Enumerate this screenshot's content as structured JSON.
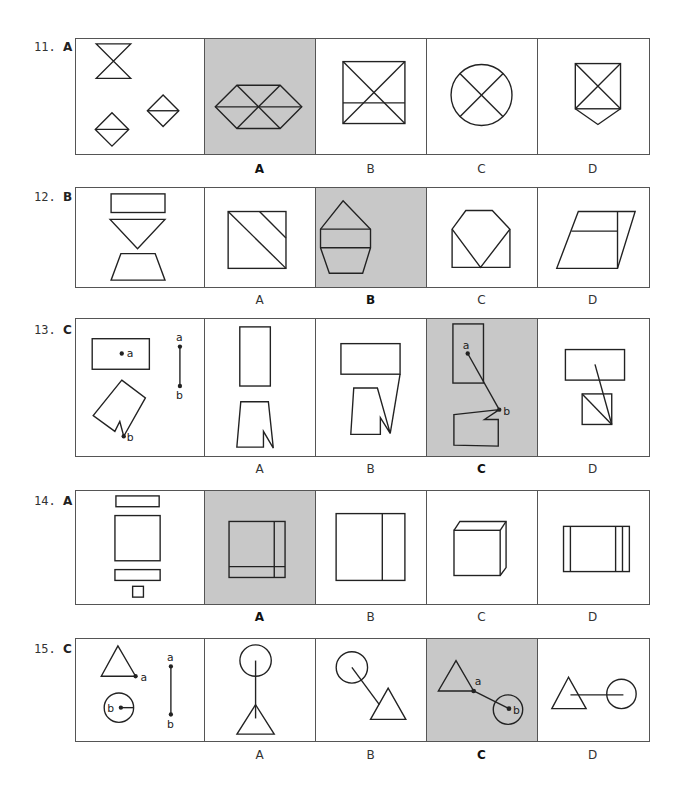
{
  "questions": [
    {
      "number": "11.",
      "answer": "A",
      "options": [
        "A",
        "B",
        "C",
        "D"
      ],
      "correct_index": 0
    },
    {
      "number": "12.",
      "answer": "B",
      "options": [
        "A",
        "B",
        "C",
        "D"
      ],
      "correct_index": 1
    },
    {
      "number": "13.",
      "answer": "C",
      "options": [
        "A",
        "B",
        "C",
        "D"
      ],
      "correct_index": 2,
      "point_labels": {
        "a": "a",
        "b": "b"
      }
    },
    {
      "number": "14.",
      "answer": "A",
      "options": [
        "A",
        "B",
        "C",
        "D"
      ],
      "correct_index": 0
    },
    {
      "number": "15.",
      "answer": "C",
      "options": [
        "A",
        "B",
        "C",
        "D"
      ],
      "correct_index": 2,
      "point_labels": {
        "a": "a",
        "b": "b"
      }
    }
  ],
  "colors": {
    "selected_panel_bg": "#c8c8c8",
    "line": "#222222",
    "border": "#555555"
  }
}
